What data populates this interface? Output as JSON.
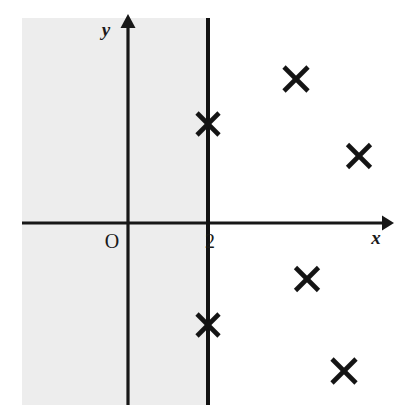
{
  "figure": {
    "width": 412,
    "height": 420,
    "background_color": "#ffffff"
  },
  "colors": {
    "background": "#ffffff",
    "shading": "#ededed",
    "axis": "#171717",
    "boundary_line": "#121212",
    "marker": "#141414",
    "text": "#1a1a1a"
  },
  "axes": {
    "x_axis": {
      "label": "x",
      "label_x": 376,
      "label_y": 244,
      "y_pixel": 223,
      "x_start": 22,
      "x_end": 388,
      "arrow": "right-arrowhead",
      "stroke_width": 3
    },
    "y_axis": {
      "label": "y",
      "label_x": 106,
      "label_y": 36,
      "x_pixel": 128,
      "y_start": 20,
      "y_end": 405,
      "arrow": "up-arrowhead",
      "stroke_width": 3
    },
    "origin": {
      "label": "O",
      "label_x": 112,
      "label_y": 248,
      "x_pixel": 128,
      "y_pixel": 223
    }
  },
  "boundary": {
    "name": "vertical-line-x-equals-2",
    "tick_label": "2",
    "tick_label_x": 205,
    "tick_label_y": 248,
    "x_pixel": 208,
    "y_start": 18,
    "y_end": 405,
    "stroke_width": 4,
    "style": "solid"
  },
  "shaded_region": {
    "name": "shaded-half-plane",
    "description": "light grey rectangle left of the line x = 2",
    "x": 22,
    "y": 18,
    "width": 186,
    "height": 387
  },
  "chart_data": {
    "type": "scatter",
    "title": "",
    "xlabel": "x",
    "ylabel": "y",
    "grid": false,
    "legend": null,
    "annotations": [
      {
        "text": "O",
        "role": "origin-label"
      },
      {
        "text": "2",
        "role": "x-axis-tick-label"
      }
    ],
    "reference_lines": [
      {
        "orientation": "vertical",
        "value": 2,
        "label": "2",
        "style": "solid"
      }
    ],
    "shaded_regions": [
      {
        "orientation": "vertical-half-plane",
        "upper_bound": 2,
        "fill": "#ededed"
      }
    ],
    "marker_style": "x-cross",
    "points": [
      {
        "name": "marker-on-line-upper",
        "px": 208,
        "py": 124,
        "size": 22,
        "on_boundary": true
      },
      {
        "name": "marker-upper-right",
        "px": 296,
        "py": 79,
        "size": 24,
        "on_boundary": false
      },
      {
        "name": "marker-far-right",
        "px": 359,
        "py": 156,
        "size": 23,
        "on_boundary": false
      },
      {
        "name": "marker-lower-middle",
        "px": 307,
        "py": 279,
        "size": 23,
        "on_boundary": false
      },
      {
        "name": "marker-on-line-lower",
        "px": 208,
        "py": 325,
        "size": 22,
        "on_boundary": true
      },
      {
        "name": "marker-bottom-right",
        "px": 344,
        "py": 371,
        "size": 24,
        "on_boundary": false
      }
    ]
  }
}
